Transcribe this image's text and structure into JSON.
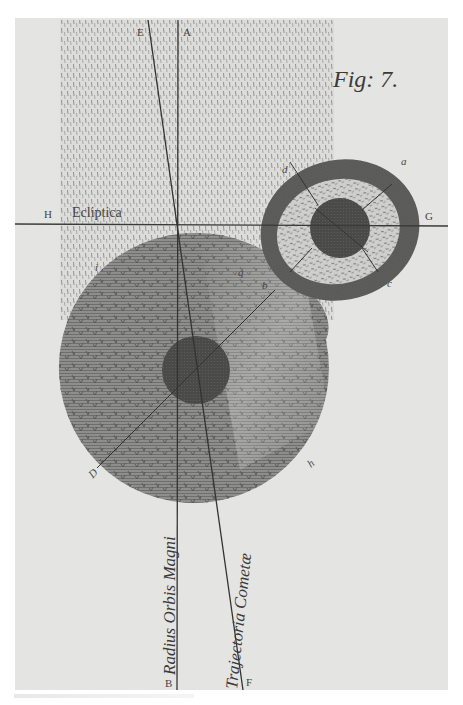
{
  "figure": {
    "caption": "Fig: 7.",
    "paper_color": "#e6e6e4",
    "ink_color": "#3b3b3b"
  },
  "labels": {
    "E": "E",
    "A": "A",
    "H": "H",
    "ecliptic": "Ecliptica",
    "G": "G",
    "d": "d",
    "a": "a",
    "c": "c",
    "b": "b",
    "q": "q",
    "i": "i",
    "D": "D",
    "h": "h",
    "B": "B",
    "F": "F"
  },
  "vertical_labels": {
    "radius": "Radius Orbis Magni",
    "trajectory": "Trajectoria Cometæ"
  },
  "elements": {
    "dashed_band": "tail / coma region above ecliptic",
    "large_disc": "comet atmosphere",
    "nucleus": "comet nucleus",
    "ringed_body": "planet with atmosphere rings"
  }
}
